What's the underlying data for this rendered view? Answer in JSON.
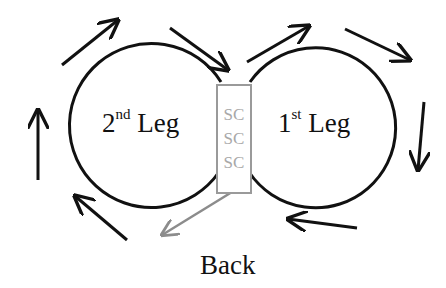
{
  "diagram": {
    "left_circle": {
      "label_num": "2",
      "label_sup": "nd",
      "label_word": "Leg"
    },
    "right_circle": {
      "label_num": "1",
      "label_sup": "st",
      "label_word": "Leg"
    },
    "center_box": {
      "items": [
        "SC",
        "SC",
        "SC"
      ]
    },
    "bottom_label": "Back",
    "colors": {
      "stroke": "#111111",
      "box_border": "#9a9a9a",
      "sc_text": "#a8a8a8",
      "back_arrow": "#8c8c8c"
    }
  }
}
